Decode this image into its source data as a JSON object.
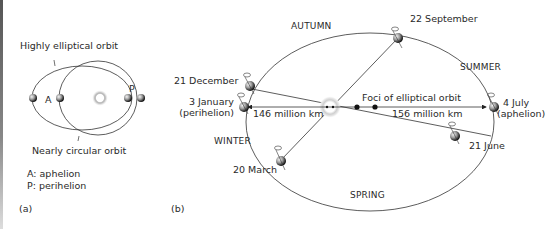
{
  "panel_a": {
    "label": "(a)",
    "elliptical_label": "Highly elliptical orbit",
    "circular_label": "Nearly circular orbit",
    "point_a": "A",
    "point_p": "P",
    "legend": [
      "A: aphelion",
      "P:  perihelion"
    ]
  },
  "panel_b": {
    "label": "(b)",
    "seasons": {
      "autumn": "AUTUMN",
      "summer": "SUMMER",
      "winter": "WINTER",
      "spring": "SPRING"
    },
    "dates": {
      "sep22": "22 September",
      "dec21": "21 December",
      "jan3": "3 January",
      "jan3_sub": "(perihelion)",
      "jul4": "4 July",
      "jul4_sub": "(aphelion)",
      "jun21": "21 June",
      "mar20": "20 March"
    },
    "foci_label": "Foci of elliptical orbit",
    "perihelion_distance": "146 million km",
    "aphelion_distance": "156 million km"
  }
}
